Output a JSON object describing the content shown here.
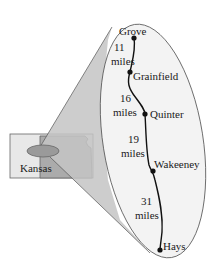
{
  "diagram": {
    "state_label": "Kansas",
    "towns": [
      {
        "name": "Grove",
        "x": 134,
        "y": 38
      },
      {
        "name": "Grainfield",
        "x": 130,
        "y": 72
      },
      {
        "name": "Quinter",
        "x": 145,
        "y": 114
      },
      {
        "name": "Wakeeney",
        "x": 153,
        "y": 171
      },
      {
        "name": "Hays",
        "x": 160,
        "y": 250
      }
    ],
    "segments": [
      {
        "from": "Grove",
        "to": "Grainfield",
        "distance": "11",
        "unit": "miles"
      },
      {
        "from": "Grainfield",
        "to": "Quinter",
        "distance": "16",
        "unit": "miles"
      },
      {
        "from": "Quinter",
        "to": "Wakeeney",
        "distance": "19",
        "unit": "miles"
      },
      {
        "from": "Wakeeney",
        "to": "Hays",
        "distance": "31",
        "unit": "miles"
      }
    ],
    "colors": {
      "map_fill": "#e6e6e6",
      "state_fill": "#a9a9a9",
      "cone_fill": "#bdbdbd",
      "ellipse_fill": "#f2f2f2",
      "route": "#111111",
      "outline": "#555555"
    }
  }
}
